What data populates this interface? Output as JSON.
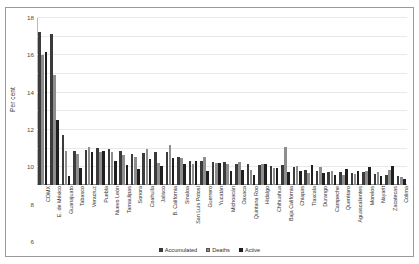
{
  "chart_data": {
    "type": "bar",
    "title": "",
    "subtitle": "",
    "xlabel": "",
    "ylabel": "Per cent",
    "ylim": [
      0,
      18
    ],
    "yticks": [
      0,
      2,
      4,
      6,
      8,
      10,
      12,
      14,
      16,
      18
    ],
    "grid": true,
    "legend_position": "bottom",
    "categories": [
      "CDMX",
      "E. de México",
      "Guanajuato",
      "Tabasco",
      "Veracruz",
      "Puebla",
      "Nuevo León",
      "Tamaulipas",
      "Sonora",
      "Coahuila",
      "Jalisco",
      "B. California",
      "Sinaloa",
      "San Luis Potosí",
      "Guerrero",
      "Yucatán",
      "Michoacán",
      "Oaxaca",
      "Quintana Roo",
      "Hidalgo",
      "Chihuahua",
      "Baja California",
      "Chiapas",
      "Tlaxcala",
      "Durango",
      "Campeche",
      "Querétaro",
      "Aguascalientes",
      "Morelos",
      "Nayarit",
      "Zacatecas",
      "Colima"
    ],
    "series": [
      {
        "name": "Accumulated",
        "color": "#3b3b3b",
        "values": [
          16.4,
          16.2,
          5.4,
          3.6,
          3.7,
          4.0,
          3.9,
          3.6,
          3.3,
          3.4,
          3.5,
          3.5,
          3.0,
          2.6,
          2.6,
          2.5,
          2.5,
          2.2,
          2.2,
          2.1,
          2.0,
          2.1,
          1.9,
          1.6,
          1.5,
          1.4,
          1.4,
          1.3,
          1.4,
          1.2,
          1.1,
          1.0
        ]
      },
      {
        "name": "Deaths",
        "color": "#8e8e8e",
        "values": [
          13.9,
          11.8,
          3.6,
          3.3,
          4.1,
          3.5,
          3.5,
          3.2,
          3.0,
          3.9,
          2.4,
          4.3,
          2.9,
          2.3,
          3.0,
          2.4,
          2.3,
          2.5,
          1.6,
          2.3,
          1.8,
          4.1,
          2.0,
          1.3,
          1.9,
          1.5,
          1.1,
          1.2,
          1.5,
          1.4,
          1.6,
          0.9
        ]
      },
      {
        "name": "Active",
        "color": "#1f1f1f",
        "values": [
          14.3,
          7.0,
          1.0,
          1.8,
          3.5,
          3.6,
          2.6,
          2.1,
          1.7,
          2.8,
          2.0,
          2.9,
          2.2,
          2.6,
          1.5,
          2.4,
          1.5,
          1.6,
          1.1,
          2.3,
          1.8,
          1.4,
          1.5,
          2.1,
          1.3,
          1.1,
          1.7,
          1.5,
          1.9,
          1.0,
          2.0,
          0.6
        ]
      }
    ]
  },
  "legend": {
    "items": [
      {
        "label": "Accumulated"
      },
      {
        "label": "Deaths"
      },
      {
        "label": "Active"
      }
    ]
  },
  "axes": {
    "y_title": "Per cent"
  }
}
